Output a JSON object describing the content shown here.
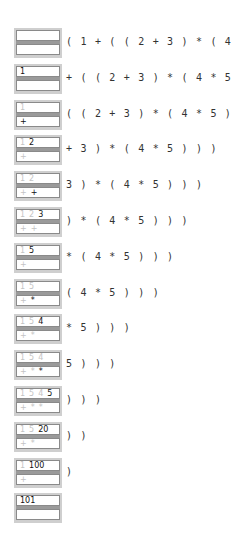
{
  "steps": [
    {
      "values": [],
      "ops": [],
      "remaining": "( 1 + ( ( 2 + 3 ) * ( 4 * 5 ) ) )"
    },
    {
      "values": [
        {
          "t": "1",
          "new": true
        }
      ],
      "ops": [],
      "remaining": "+ ( ( 2 + 3 ) * ( 4 * 5 ) ) )"
    },
    {
      "values": [
        {
          "t": "1",
          "new": false
        }
      ],
      "ops": [
        {
          "t": "+",
          "new": true
        }
      ],
      "remaining": "( ( 2 + 3 ) * ( 4 * 5 ) ) )"
    },
    {
      "values": [
        {
          "t": "1",
          "new": false
        },
        {
          "t": "2",
          "new": true
        }
      ],
      "ops": [
        {
          "t": "+",
          "new": false
        }
      ],
      "remaining": "+ 3 ) * ( 4 * 5 ) ) )"
    },
    {
      "values": [
        {
          "t": "1",
          "new": false
        },
        {
          "t": "2",
          "new": false
        }
      ],
      "ops": [
        {
          "t": "+",
          "new": false
        },
        {
          "t": "+",
          "new": true
        }
      ],
      "remaining": "3 ) * ( 4 * 5 ) ) )"
    },
    {
      "values": [
        {
          "t": "1",
          "new": false
        },
        {
          "t": "2",
          "new": false
        },
        {
          "t": "3",
          "new": true
        }
      ],
      "ops": [
        {
          "t": "+",
          "new": false
        },
        {
          "t": "+",
          "new": false
        }
      ],
      "remaining": ") * ( 4 * 5 ) ) )"
    },
    {
      "values": [
        {
          "t": "1",
          "new": false
        },
        {
          "t": "5",
          "new": true
        }
      ],
      "ops": [
        {
          "t": "+",
          "new": false
        }
      ],
      "remaining": "* ( 4 * 5 ) ) )"
    },
    {
      "values": [
        {
          "t": "1",
          "new": false
        },
        {
          "t": "5",
          "new": false
        }
      ],
      "ops": [
        {
          "t": "+",
          "new": false
        },
        {
          "t": "*",
          "new": true
        }
      ],
      "remaining": "( 4 * 5 ) ) )"
    },
    {
      "values": [
        {
          "t": "1",
          "new": false
        },
        {
          "t": "5",
          "new": false
        },
        {
          "t": "4",
          "new": true
        }
      ],
      "ops": [
        {
          "t": "+",
          "new": false
        },
        {
          "t": "*",
          "new": false
        }
      ],
      "remaining": "* 5 ) ) )"
    },
    {
      "values": [
        {
          "t": "1",
          "new": false
        },
        {
          "t": "5",
          "new": false
        },
        {
          "t": "4",
          "new": false
        }
      ],
      "ops": [
        {
          "t": "+",
          "new": false
        },
        {
          "t": "*",
          "new": false
        },
        {
          "t": "*",
          "new": true
        }
      ],
      "remaining": "5 ) ) )"
    },
    {
      "values": [
        {
          "t": "1",
          "new": false
        },
        {
          "t": "5",
          "new": false
        },
        {
          "t": "4",
          "new": false
        },
        {
          "t": "5",
          "new": true
        }
      ],
      "ops": [
        {
          "t": "+",
          "new": false
        },
        {
          "t": "*",
          "new": false
        },
        {
          "t": "*",
          "new": false
        }
      ],
      "remaining": ") ) )"
    },
    {
      "values": [
        {
          "t": "1",
          "new": false
        },
        {
          "t": "5",
          "new": false
        },
        {
          "t": "20",
          "new": true
        }
      ],
      "ops": [
        {
          "t": "+",
          "new": false
        },
        {
          "t": "*",
          "new": false
        }
      ],
      "remaining": ") )"
    },
    {
      "values": [
        {
          "t": "1",
          "new": false
        },
        {
          "t": "100",
          "new": true
        }
      ],
      "ops": [
        {
          "t": "+",
          "new": false
        }
      ],
      "remaining": ")"
    },
    {
      "values": [
        {
          "t": "101",
          "new": true
        }
      ],
      "ops": [],
      "remaining": ""
    }
  ]
}
